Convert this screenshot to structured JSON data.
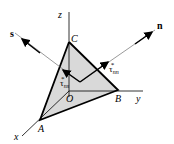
{
  "diagram": {
    "labels": {
      "z": "z",
      "y": "y",
      "x": "x",
      "A": "A",
      "B": "B",
      "C": "C",
      "O": "O",
      "s": "s",
      "n": "n",
      "tau_ns": "τ",
      "tau_ns_sub": "ns",
      "tau_nn": "τ",
      "tau_nn_sub": "nn",
      "star": "*"
    },
    "colors": {
      "fill": "#d9d9d9",
      "line": "#000000"
    }
  }
}
